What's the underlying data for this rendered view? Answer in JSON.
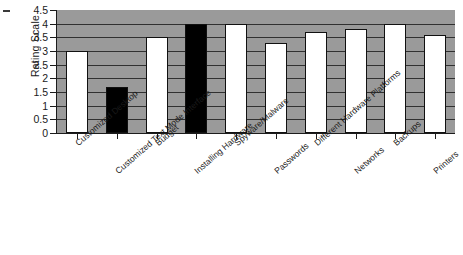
{
  "chart_data": {
    "type": "bar",
    "title": "",
    "xlabel": "",
    "ylabel": "Rating Scale",
    "ylim": [
      0,
      4.5
    ],
    "ytick_labels": [
      "0",
      "0.5",
      "1",
      "1.5",
      "2",
      "2.5",
      "3",
      "3.5",
      "4",
      "4.5"
    ],
    "ytick_values": [
      0,
      0.5,
      1,
      1.5,
      2,
      2.5,
      3,
      3.5,
      4,
      4.5
    ],
    "grid": "horizontal",
    "legend": "none",
    "plot_background_color": "#9a9a9a",
    "bar_fill_colors": [
      "#ffffff",
      "#000000"
    ],
    "categories": [
      "Customized Desktop",
      "Customized Text Mode Interface",
      "Budget",
      "Installing Hardware",
      "Spyware/Malware",
      "Passwords",
      "Different Hardware Platforms",
      "Networks",
      "Backups",
      "Printers"
    ],
    "values": [
      3.0,
      1.7,
      3.5,
      4.0,
      4.0,
      3.3,
      3.7,
      3.8,
      4.0,
      3.6
    ],
    "bar_colors": [
      "white",
      "black",
      "white",
      "black",
      "white",
      "white",
      "white",
      "white",
      "white",
      "white"
    ]
  }
}
